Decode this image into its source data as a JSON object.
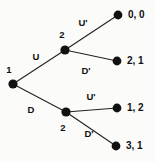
{
  "figure": {
    "type": "extensive-form-game-tree",
    "background_color": "#fbfbf9",
    "node_color": "#111111",
    "edge_color": "#222222"
  },
  "nodes": {
    "root": {
      "player": "1",
      "x": 13,
      "y": 84,
      "label_x": 9,
      "label_y": 70
    },
    "upper": {
      "player": "2",
      "x": 65,
      "y": 50,
      "label_x": 62,
      "label_y": 35
    },
    "lower": {
      "player": "2",
      "x": 66,
      "y": 112,
      "label_x": 63,
      "label_y": 128
    }
  },
  "terminals": [
    {
      "id": "t1",
      "x": 118,
      "y": 15,
      "payoff": "0, 0",
      "text_x": 128,
      "text_y": 15
    },
    {
      "id": "t2",
      "x": 117,
      "y": 61,
      "payoff": "2, 1",
      "text_x": 127,
      "text_y": 61
    },
    {
      "id": "t3",
      "x": 117,
      "y": 108,
      "payoff": "1, 2",
      "text_x": 127,
      "text_y": 108
    },
    {
      "id": "t4",
      "x": 116,
      "y": 146,
      "payoff": "3, 1",
      "text_x": 126,
      "text_y": 146
    }
  ],
  "edges": [
    {
      "id": "e-u",
      "action": "U",
      "x1": 13,
      "y1": 84,
      "x2": 65,
      "y2": 50,
      "label_x": 36,
      "label_y": 57
    },
    {
      "id": "e-d",
      "action": "D",
      "x1": 13,
      "y1": 84,
      "x2": 66,
      "y2": 112,
      "label_x": 31,
      "label_y": 110
    },
    {
      "id": "e-uu",
      "action": "U'",
      "x1": 65,
      "y1": 50,
      "x2": 118,
      "y2": 15,
      "label_x": 83,
      "label_y": 23
    },
    {
      "id": "e-ud",
      "action": "D'",
      "x1": 65,
      "y1": 50,
      "x2": 117,
      "y2": 61,
      "label_x": 86,
      "label_y": 71
    },
    {
      "id": "e-du",
      "action": "U'",
      "x1": 66,
      "y1": 112,
      "x2": 117,
      "y2": 108,
      "label_x": 91,
      "label_y": 97
    },
    {
      "id": "e-dd",
      "action": "D'",
      "x1": 66,
      "y1": 112,
      "x2": 116,
      "y2": 146,
      "label_x": 89,
      "label_y": 134
    }
  ]
}
